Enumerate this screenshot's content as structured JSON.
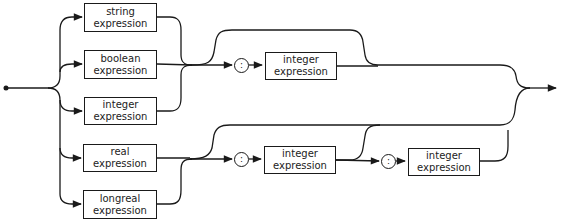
{
  "diagram": {
    "type": "syntax-diagram",
    "boxes": {
      "string": {
        "line1": "string",
        "line2": "expression"
      },
      "boolean": {
        "line1": "boolean",
        "line2": "expression"
      },
      "integer": {
        "line1": "integer",
        "line2": "expression"
      },
      "real": {
        "line1": "real",
        "line2": "expression"
      },
      "longreal": {
        "line1": "longreal",
        "line2": "expression"
      },
      "width_integer_top": {
        "line1": "integer",
        "line2": "expression"
      },
      "width_integer_bottom": {
        "line1": "integer",
        "line2": "expression"
      },
      "precision_integer": {
        "line1": "integer",
        "line2": "expression"
      }
    },
    "colon_symbol": ":",
    "line_color": "#1a1a1a"
  }
}
